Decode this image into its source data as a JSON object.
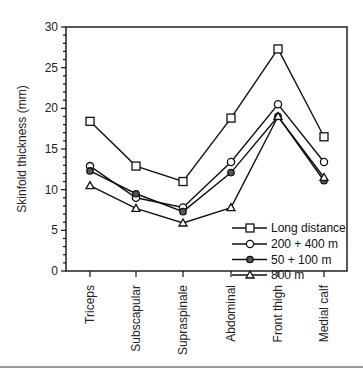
{
  "chart_data": {
    "type": "line",
    "title": "",
    "xlabel": "",
    "ylabel": "Skinfold thickness (mm)",
    "ylim": [
      0,
      30
    ],
    "yticks": [
      0,
      5,
      10,
      15,
      20,
      25,
      30
    ],
    "grid": false,
    "legend_position": "lower right (inside)",
    "categories": [
      "Triceps",
      "Subscapular",
      "Supraspinale",
      "Abdominal",
      "Front thigh",
      "Medial calf"
    ],
    "series": [
      {
        "name": "Long distance",
        "marker": "square-open",
        "values": [
          18.4,
          12.9,
          11.0,
          18.8,
          27.3,
          16.5
        ]
      },
      {
        "name": "200 + 400 m",
        "marker": "circle-open",
        "values": [
          12.9,
          9.0,
          7.8,
          13.4,
          20.5,
          13.4
        ]
      },
      {
        "name": "50 + 100 m",
        "marker": "circle-filled",
        "values": [
          12.3,
          9.5,
          7.3,
          12.1,
          19.0,
          11.1
        ]
      },
      {
        "name": "800 m",
        "marker": "triangle",
        "values": [
          10.5,
          7.7,
          5.9,
          7.8,
          19.0,
          11.5
        ]
      }
    ]
  },
  "axis": {
    "y_title": "Skinfold thickness (mm)",
    "y_ticks": [
      "0",
      "5",
      "10",
      "15",
      "20",
      "25",
      "30"
    ]
  },
  "legend": {
    "items": [
      "Long distance",
      "200 + 400 m",
      "50 + 100 m",
      "800 m"
    ]
  }
}
